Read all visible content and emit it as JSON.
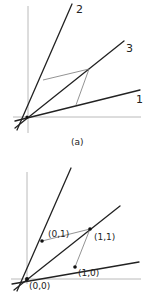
{
  "figure": {
    "panel_a": {
      "caption": "(a)",
      "line_labels": {
        "line1": "1",
        "line2": "2",
        "line3": "3"
      }
    },
    "panel_b": {
      "point_labels": {
        "origin": "(0,0)",
        "p01": "(0,1)",
        "p11": "(1,1)",
        "p10": "(1,0)"
      }
    },
    "colors": {
      "ink": "#222222",
      "axis": "#a8a8a8",
      "construction": "#777777"
    }
  }
}
